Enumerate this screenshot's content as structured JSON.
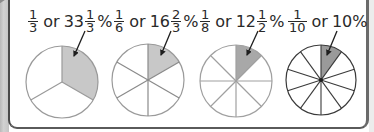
{
  "colors": {
    "shaded": "#c8c8c8",
    "line_light": "#9a9a9a",
    "line_dark": "#3a3a3a",
    "text": "#2a2a2a",
    "arrow": "#1e1e1e"
  },
  "pies": [
    {
      "label": {
        "frac_num": "1",
        "frac_den": "3",
        "word": "or",
        "whole": "33",
        "mixed_num": "1",
        "mixed_den": "3",
        "percent": "%"
      },
      "segments": 3,
      "shaded_segments": 1
    },
    {
      "label": {
        "frac_num": "1",
        "frac_den": "6",
        "word": "or",
        "whole": "16",
        "mixed_num": "2",
        "mixed_den": "3",
        "percent": "%"
      },
      "segments": 6,
      "shaded_segments": 1
    },
    {
      "label": {
        "frac_num": "1",
        "frac_den": "8",
        "word": "or",
        "whole": "12",
        "mixed_num": "1",
        "mixed_den": "2",
        "percent": "%"
      },
      "segments": 8,
      "shaded_segments": 1
    },
    {
      "label": {
        "frac_num": "1",
        "frac_den": "10",
        "word": "or",
        "whole": "10%"
      },
      "segments": 10,
      "shaded_segments": 1
    }
  ]
}
